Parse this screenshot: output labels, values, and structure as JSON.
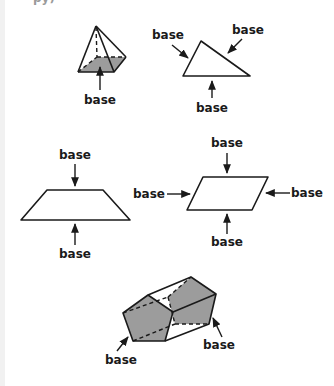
{
  "header": {
    "clipped_text": "py)"
  },
  "colors": {
    "line": "#1a1a1a",
    "shade": "#9c9c9c",
    "background": "#ffffff",
    "edge_strip": "#f1f1f1"
  },
  "figures": [
    {
      "name": "square-pyramid",
      "labels": [
        "base"
      ]
    },
    {
      "name": "triangle",
      "labels": [
        "base",
        "base",
        "base"
      ]
    },
    {
      "name": "trapezoid",
      "labels": [
        "base",
        "base"
      ]
    },
    {
      "name": "parallelogram",
      "labels": [
        "base",
        "base",
        "base",
        "base"
      ]
    },
    {
      "name": "pentagonal-prism",
      "labels": [
        "base",
        "base"
      ]
    }
  ]
}
